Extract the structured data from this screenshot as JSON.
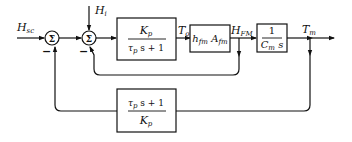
{
  "diagram": {
    "type": "block-diagram",
    "inputs": {
      "setpoint": {
        "label": "H",
        "sub": "sc"
      },
      "disturbance": {
        "label": "H",
        "sub": "i"
      }
    },
    "summers": [
      {
        "id": "sum1",
        "symbol": "Σ",
        "minus_sign": "−"
      },
      {
        "id": "sum2",
        "symbol": "Σ",
        "minus_sign": "−"
      }
    ],
    "blocks": [
      {
        "id": "plant",
        "num": {
          "label": "K",
          "sub": "p"
        },
        "den": {
          "a": "τ",
          "a_sub": "p",
          "rest": " s + 1"
        }
      },
      {
        "id": "heat",
        "text": {
          "a": "h",
          "a_sub": "fm",
          "b": " A",
          "b_sub": "fm"
        }
      },
      {
        "id": "integrator",
        "num": "1",
        "den": {
          "label": "C",
          "sub": "m",
          "rest": " s"
        }
      },
      {
        "id": "feedback",
        "num": {
          "a": "τ",
          "a_sub": "p",
          "rest": " s + 1"
        },
        "den": {
          "label": "K",
          "sub": "p"
        }
      }
    ],
    "signals": {
      "To": {
        "label": "T",
        "sub": "o"
      },
      "HFM": {
        "label": "H",
        "sub": "FM"
      },
      "Tm": {
        "label": "T",
        "sub": "m"
      }
    }
  }
}
